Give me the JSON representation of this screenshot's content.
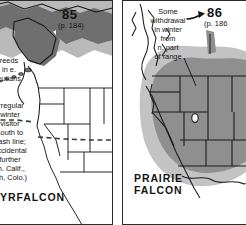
{
  "figure": {
    "kind": "field-guide-range-maps",
    "panel_count": 2
  },
  "colors": {
    "ink": "#141414",
    "border": "#2b2b2b",
    "paper": "#ffffff",
    "range_dark": "#7d7d7d",
    "range_mid": "#9a9a9a",
    "range_light": "#c3c3c3",
    "coast_line": "#1a1a1a"
  },
  "panels": [
    {
      "id": "gyrfalcon",
      "plate_number": "85",
      "page_ref": "(p. 184)",
      "species": "GYRFALCON",
      "notes": [
        {
          "id": "breeding-note",
          "text": "Breeds\nin e.\nAleutians",
          "visible_text": "reeds\nin e.\neutians"
        },
        {
          "id": "winter-note",
          "text": "Irregular\nwinter\nvisitor\nsouth to\ndash line;\naccidental\nfurther\n(n. Calif.,\nUtah, Colo.)",
          "visible_text": "Irregular\nwinter\nvisitor\nsouth to\ndash line;\naccidental\nfurther\n(n. Calif.,\ntah, Colo.)"
        }
      ],
      "features": {
        "dashed_limit_line": true,
        "shading_tones": 2
      }
    },
    {
      "id": "prairie-falcon",
      "plate_number": "86",
      "page_ref": "(p. 186",
      "species": "PRAIRIE\nFALCON",
      "notes": [
        {
          "id": "withdrawal-note",
          "text": "Some\nwithdrawal\nin winter\nfrom\nn. part\nof range",
          "visible_text": "Some\nwithdrawal\nin winter\nfrom\nn. part\nof range"
        }
      ],
      "features": {
        "arrow_marker": true,
        "leader_lines": 2,
        "shading_tones": 2
      }
    }
  ]
}
